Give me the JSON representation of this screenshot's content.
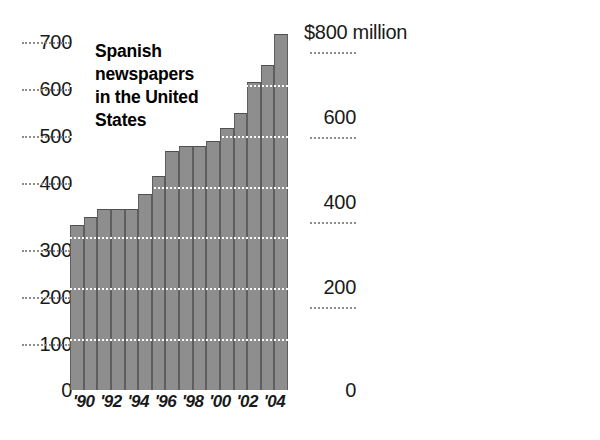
{
  "chart_data": [
    {
      "type": "bar",
      "id": "spanish-newspapers",
      "title": "Spanish newspapers in the United States",
      "title_lines": [
        "Spanish",
        "newspapers",
        "in the United",
        "States"
      ],
      "xlabel": "",
      "ylabel": "",
      "ylim": [
        0,
        700
      ],
      "ytick_labels": [
        "700",
        "600",
        "500",
        "400",
        "300",
        "200",
        "100",
        "0"
      ],
      "ytick_values": [
        700,
        600,
        500,
        400,
        300,
        200,
        100,
        0
      ],
      "grid": true,
      "grid_style": "dotted",
      "legend": "none",
      "xtick_labels": [
        "'90",
        "'92",
        "'94",
        "'96",
        "'98",
        "'00",
        "'02",
        "'04"
      ],
      "categories": [
        "1989",
        "1990",
        "1991",
        "1992",
        "1993",
        "1994",
        "1995",
        "1996",
        "1997",
        "1998",
        "1999",
        "2000",
        "2001",
        "2002",
        "2003",
        "2004"
      ],
      "values": [
        325,
        340,
        355,
        355,
        355,
        385,
        420,
        470,
        480,
        480,
        490,
        515,
        545,
        605,
        640,
        700
      ]
    },
    {
      "type": "bar",
      "id": "ad-revenue",
      "title": "Ad revenue",
      "title_lines": [
        "Ad revenue"
      ],
      "xlabel": "",
      "ylabel": "",
      "ylim": [
        0,
        800
      ],
      "ytick_labels": [
        "$800 million",
        "600",
        "400",
        "200",
        "0"
      ],
      "ytick_values": [
        800,
        600,
        400,
        200,
        0
      ],
      "grid": true,
      "grid_style": "dotted",
      "legend": "none",
      "xtick_labels": [
        "'90",
        "'92",
        "'94",
        "'96",
        "'98",
        "'00",
        "'02"
      ],
      "categories": [
        "1989",
        "1990",
        "1991",
        "1992",
        "1993",
        "1994",
        "1995",
        "1996",
        "1997",
        "1998",
        "1999",
        "2000",
        "2001",
        "2002",
        "2003"
      ],
      "values": [
        110,
        120,
        140,
        175,
        195,
        230,
        265,
        310,
        355,
        430,
        500,
        510,
        580,
        680,
        740
      ]
    }
  ],
  "colors": {
    "bar_fill": "#8e8e8e",
    "bar_edge": "#5e5e5e",
    "grid_dark": "#8d8d8d",
    "grid_light": "#ffffff",
    "text": "#1a1a1a",
    "background": "#ffffff"
  },
  "left": {
    "title_l1": "Spanish",
    "title_l2": "newspapers",
    "title_l3": "in the United",
    "title_l4": "States",
    "yticks": [
      {
        "label": "700",
        "value": 700
      },
      {
        "label": "600",
        "value": 600
      },
      {
        "label": "500",
        "value": 500
      },
      {
        "label": "400",
        "value": 400
      },
      {
        "label": "300",
        "value": 300
      },
      {
        "label": "200",
        "value": 200
      },
      {
        "label": "100",
        "value": 100
      },
      {
        "label": "0",
        "value": 0
      }
    ],
    "xticks": [
      "'90",
      "'92",
      "'94",
      "'96",
      "'98",
      "'00",
      "'02",
      "'04"
    ]
  },
  "right": {
    "title_l1": "Ad revenue",
    "yticks": [
      {
        "label": "$800 million",
        "value": 800
      },
      {
        "label": "600",
        "value": 600
      },
      {
        "label": "400",
        "value": 400
      },
      {
        "label": "200",
        "value": 200
      },
      {
        "label": "0",
        "value": 0
      }
    ],
    "xticks": [
      "'90",
      "'92",
      "'94",
      "'96",
      "'98",
      "'00",
      "'02"
    ]
  }
}
